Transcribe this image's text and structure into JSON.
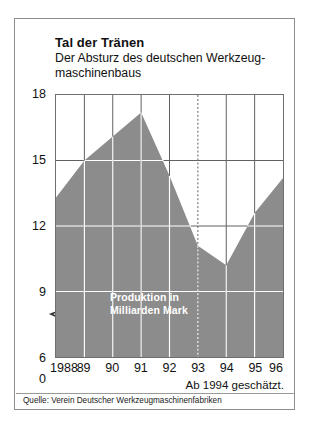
{
  "card": {
    "title": "Tal der Tränen",
    "subtitle_line1": "Der Absturz des deutschen Werkzeug-",
    "subtitle_line2": "maschinenbaus",
    "note_estimate": "Ab 1994 geschätzt.",
    "source": "Quelle: Verein Deutscher Werkzeugmaschinenfabriken",
    "series_label_line1": "Produktion in",
    "series_label_line2": "Milliarden Mark"
  },
  "colors": {
    "area_fill": "#8c8c8c",
    "grid_light": "#ffffff",
    "grid_dark": "#5f5f5f",
    "border": "#6f6f6f",
    "card_border": "#8d8d8d",
    "text": "#111111",
    "label_on_fill": "#ffffff"
  },
  "chart_data": {
    "type": "area",
    "title": "Tal der Tränen",
    "subtitle": "Der Absturz des deutschen Werkzeugmaschinenbaus",
    "xlabel": "",
    "ylabel": "Produktion in Milliarden Mark",
    "categories": [
      "1988",
      "89",
      "90",
      "91",
      "92",
      "93",
      "94",
      "95",
      "96"
    ],
    "x_tick_labels": [
      "1988",
      "89",
      "90",
      "91",
      "92",
      "93",
      "94",
      "95",
      "96"
    ],
    "values": [
      13.3,
      15.0,
      16.1,
      17.2,
      14.3,
      11.1,
      10.2,
      12.6,
      14.2
    ],
    "ylim": [
      6,
      18
    ],
    "y_tick_labels": [
      "18",
      "15",
      "12",
      "9",
      "6",
      "0"
    ],
    "y_ticks": [
      18,
      15,
      12,
      9,
      6,
      0
    ],
    "axis_break": true,
    "axis_break_between": [
      0,
      6
    ],
    "grid": true,
    "legend": "none",
    "annotations": [
      {
        "text": "Produktion in Milliarden Mark",
        "type": "series-label",
        "inside_area": true
      },
      {
        "text": "Ab 1994 geschätzt.",
        "type": "footnote"
      },
      {
        "text": "Quelle: Verein Deutscher Werkzeugmaschinenfabriken",
        "type": "source"
      }
    ],
    "forecast_boundary_category": "93",
    "forecast_note": "Ab 1994 geschätzt."
  }
}
